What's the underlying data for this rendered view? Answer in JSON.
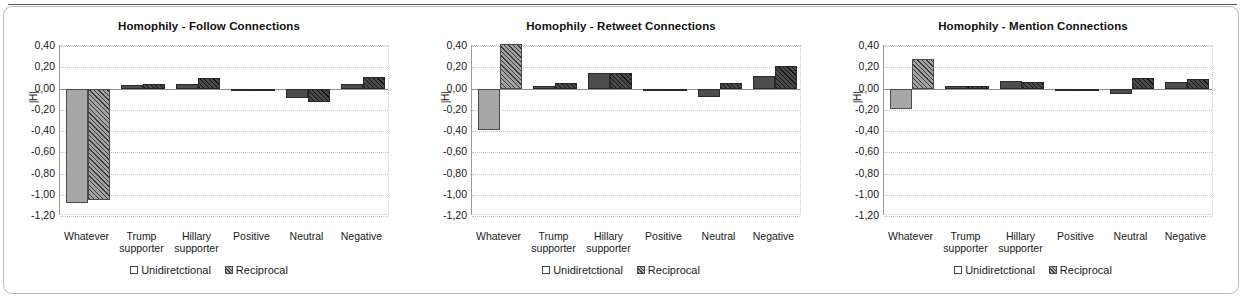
{
  "figure": {
    "panel_count": 3,
    "y_ticks": [
      "0,40",
      "0,20",
      "0,00",
      "-0,20",
      "-0,40",
      "-0,60",
      "-0,80",
      "-1,00",
      "-1,20"
    ],
    "y_axis_label": "|H|",
    "categories": [
      {
        "line1": "Whatever",
        "line2": ""
      },
      {
        "line1": "Trump",
        "line2": "supporter"
      },
      {
        "line1": "Hillary",
        "line2": "supporter"
      },
      {
        "line1": "Positive",
        "line2": ""
      },
      {
        "line1": "Neutral",
        "line2": ""
      },
      {
        "line1": "Negative",
        "line2": ""
      }
    ],
    "legend": [
      {
        "label": "Unidiretctional",
        "swatch": "unidirectional-swatch"
      },
      {
        "label": "Reciprocal",
        "swatch": "reciprocal-swatch"
      }
    ],
    "colors": {
      "unidirectional_fill": "#a7a7a7",
      "unidirectional_fill_dark": "#4d4d4d",
      "reciprocal_fill": "#a3a3a3",
      "reciprocal_fill_dark": "#4a4a4a",
      "bar_outline": "#4a4a4a",
      "gridline": "#c4c4c4",
      "axis": "#8f8f8f",
      "frame_border": "#b9b9b9",
      "top_rule": "#555555",
      "text": "#1a1a1a"
    }
  },
  "chart_data": [
    {
      "type": "bar",
      "title": "Homophily - Follow Connections",
      "xlabel": "",
      "ylabel": "|H|",
      "ylim": [
        -1.2,
        0.4
      ],
      "ytick_step": 0.2,
      "grid": true,
      "legend_position": "bottom",
      "categories": [
        "Whatever",
        "Trump supporter",
        "Hillary supporter",
        "Positive",
        "Neutral",
        "Negative"
      ],
      "series": [
        {
          "name": "Unidiretctional",
          "values": [
            -1.08,
            0.03,
            0.04,
            -0.005,
            -0.09,
            0.04
          ],
          "shade": [
            "light",
            "dark",
            "dark",
            "dark",
            "dark",
            "dark"
          ]
        },
        {
          "name": "Reciprocal",
          "values": [
            -1.05,
            0.04,
            0.1,
            -0.005,
            -0.13,
            0.11
          ],
          "shade": [
            "light",
            "dark",
            "dark",
            "dark",
            "dark",
            "dark"
          ]
        }
      ]
    },
    {
      "type": "bar",
      "title": "Homophily - Retweet Connections",
      "xlabel": "",
      "ylabel": "|H|",
      "ylim": [
        -1.2,
        0.4
      ],
      "ytick_step": 0.2,
      "grid": true,
      "legend_position": "bottom",
      "categories": [
        "Whatever",
        "Trump supporter",
        "Hillary supporter",
        "Positive",
        "Neutral",
        "Negative"
      ],
      "series": [
        {
          "name": "Unidiretctional",
          "values": [
            -0.39,
            0.02,
            0.15,
            -0.005,
            -0.08,
            0.12
          ],
          "shade": [
            "light",
            "dark",
            "dark",
            "dark",
            "dark",
            "dark"
          ]
        },
        {
          "name": "Reciprocal",
          "values": [
            0.42,
            0.05,
            0.15,
            -0.01,
            0.05,
            0.21
          ],
          "shade": [
            "light",
            "dark",
            "dark",
            "dark",
            "dark",
            "dark"
          ]
        }
      ]
    },
    {
      "type": "bar",
      "title": "Homophily - Mention Connections",
      "xlabel": "",
      "ylabel": "|H|",
      "ylim": [
        -1.2,
        0.4
      ],
      "ytick_step": 0.2,
      "grid": true,
      "legend_position": "bottom",
      "categories": [
        "Whatever",
        "Trump supporter",
        "Hillary supporter",
        "Positive",
        "Neutral",
        "Negative"
      ],
      "series": [
        {
          "name": "Unidiretctional",
          "values": [
            -0.19,
            0.02,
            0.07,
            -0.01,
            -0.05,
            0.06
          ],
          "shade": [
            "light",
            "dark",
            "dark",
            "dark",
            "dark",
            "dark"
          ]
        },
        {
          "name": "Reciprocal",
          "values": [
            0.28,
            0.02,
            0.06,
            -0.01,
            0.1,
            0.09
          ],
          "shade": [
            "light",
            "dark",
            "dark",
            "dark",
            "dark",
            "dark"
          ]
        }
      ]
    }
  ]
}
